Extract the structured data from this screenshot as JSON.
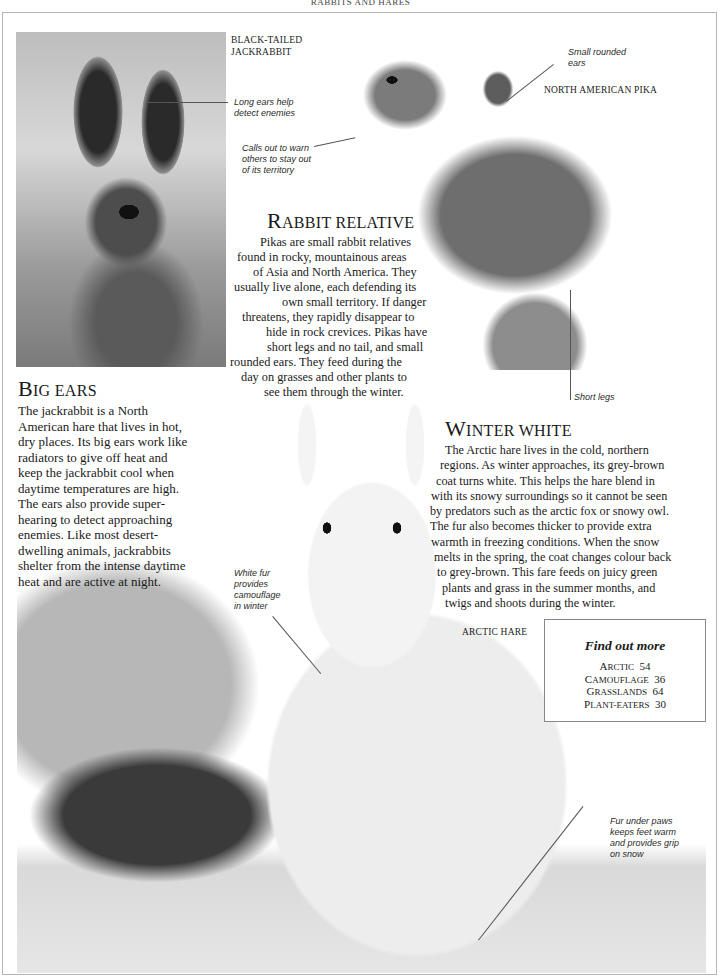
{
  "running_head": "RABBITS AND HARES",
  "labels": {
    "jackrabbit": [
      "BLACK-TAILED",
      "JACKRABBIT"
    ],
    "pika": "NORTH AMERICAN PIKA",
    "arctic_hare": "ARCTIC HARE"
  },
  "callouts": {
    "long_ears": [
      "Long ears help",
      "detect enemies"
    ],
    "calls_out": [
      "Calls out to warn",
      "others to stay out",
      "of its territory"
    ],
    "small_ears": [
      "Small rounded",
      "ears"
    ],
    "short_legs": "Short legs",
    "white_fur": [
      "White fur",
      "provides",
      "camouflage",
      "in winter"
    ],
    "fur_paws": [
      "Fur under paws",
      "keeps feet warm",
      "and provides grip",
      "on snow"
    ]
  },
  "sections": {
    "rabbit_relative": {
      "heading_cap": "R",
      "heading_rest": "abbit relative",
      "lines": [
        "Pikas are small rabbit relatives",
        "found in rocky, mountainous areas",
        "of Asia and North America. They",
        "usually live alone, each defending its",
        "own small territory. If danger",
        "threatens, they rapidly disappear to",
        "hide in rock crevices. Pikas have",
        "short legs and no tail, and small",
        "rounded ears. They feed during the",
        "day on grasses and other plants to",
        "see them through the winter."
      ]
    },
    "big_ears": {
      "heading_cap": "B",
      "heading_rest": "ig ears",
      "lines": [
        "The jackrabbit is a North",
        "American hare that lives in hot,",
        "dry places. Its big ears work like",
        "radiators to give off heat and",
        "keep the jackrabbit cool when",
        "daytime temperatures are high.",
        "The ears also provide super-",
        "hearing to detect approaching",
        "enemies. Like most desert-",
        "dwelling animals, jackrabbits",
        "shelter from the intense daytime",
        "heat and are active at night."
      ]
    },
    "winter_white": {
      "heading_cap": "W",
      "heading_rest": "inter white",
      "lines": [
        "The Arctic hare lives in the cold, northern",
        "regions. As winter approaches, its grey-brown",
        "coat turns white. This helps the hare blend in",
        "with its snowy surroundings so it cannot be seen",
        "by predators such as the arctic fox or snowy owl.",
        "The fur also becomes thicker to provide extra",
        "warmth in freezing conditions. When the snow",
        "melts in the spring, the coat changes colour back",
        "to grey-brown. This fare feeds on juicy green",
        "plants and grass in the summer months, and",
        "twigs and shoots during the winter."
      ]
    }
  },
  "find_out_more": {
    "title": "Find out more",
    "items": [
      {
        "cap": "A",
        "rest": "rctic",
        "page": "54"
      },
      {
        "cap": "C",
        "rest": "amouflage",
        "page": "36"
      },
      {
        "cap": "G",
        "rest": "rasslands",
        "page": "64"
      },
      {
        "cap": "P",
        "rest": "lant-eaters",
        "page": "30"
      }
    ]
  }
}
